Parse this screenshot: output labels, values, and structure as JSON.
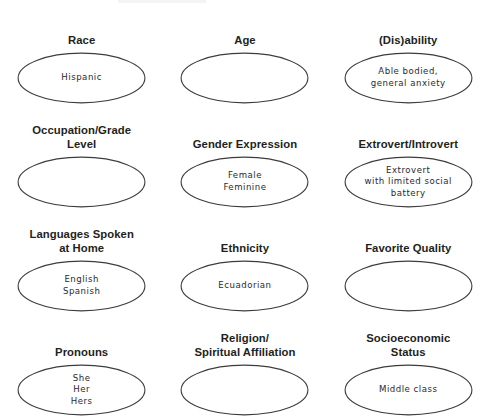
{
  "page": {
    "background_color": "#ffffff",
    "label_color": "#231f20",
    "bubble_stroke_color": "#3c3c3c",
    "bubble_fill_color": "#ffffff",
    "bubble_text_color": "#2b2b2b"
  },
  "rows": [
    {
      "cells": [
        {
          "label": "Race",
          "value": "Hispanic",
          "filled": true
        },
        {
          "label": "Age",
          "value": "",
          "filled": false
        },
        {
          "label": "(Dis)ability",
          "value": "Able bodied,\ngeneral anxiety",
          "filled": true
        }
      ]
    },
    {
      "cells": [
        {
          "label": "Occupation/Grade\nLevel",
          "value": "",
          "filled": false
        },
        {
          "label": "Gender Expression",
          "value": "Female\nFeminine",
          "filled": true
        },
        {
          "label": "Extrovert/Introvert",
          "value": "Extrovert\nwith limited social\nbattery",
          "filled": true
        }
      ]
    },
    {
      "cells": [
        {
          "label": "Languages Spoken\nat Home",
          "value": "English\nSpanish",
          "filled": true
        },
        {
          "label": "Ethnicity",
          "value": "Ecuadorian",
          "filled": true
        },
        {
          "label": "Favorite Quality",
          "value": "",
          "filled": false
        }
      ]
    },
    {
      "cells": [
        {
          "label": "Pronouns",
          "value": "She\nHer\nHers",
          "filled": true
        },
        {
          "label": "Religion/\nSpiritual Affiliation",
          "value": "",
          "filled": false
        },
        {
          "label": "Socioeconomic\nStatus",
          "value": "Middle class",
          "filled": true
        }
      ]
    }
  ]
}
